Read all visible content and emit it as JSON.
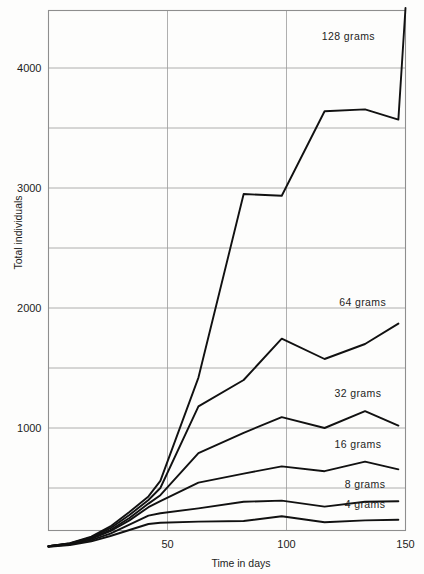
{
  "chart_data": {
    "type": "line",
    "title": "",
    "xlabel": "Time in days",
    "ylabel": "Total individuals",
    "xlim": [
      0,
      150
    ],
    "ylim": [
      0,
      4600
    ],
    "grid": true,
    "grid_x_values": [
      50,
      100
    ],
    "grid_y_values": [
      500,
      1000,
      1500,
      2000,
      2500,
      3000,
      3500,
      4000
    ],
    "xticks": [
      50,
      100,
      150
    ],
    "xtick_labels": [
      "50",
      "100",
      "150"
    ],
    "yticks": [
      1000,
      2000,
      3000,
      4000
    ],
    "ytick_labels": [
      "1000",
      "2000",
      "3000",
      "4000"
    ],
    "legend_position": "inline-labels",
    "series": [
      {
        "name": "128 grams",
        "label": "128 grams",
        "x": [
          0,
          9,
          18,
          26,
          34,
          42,
          47,
          63,
          82,
          98,
          116,
          133,
          147,
          150
        ],
        "values": [
          15,
          40,
          95,
          180,
          300,
          430,
          560,
          1420,
          2950,
          2935,
          3640,
          3655,
          3570,
          4500
        ]
      },
      {
        "name": "64 grams",
        "label": "64 grams",
        "x": [
          0,
          9,
          18,
          26,
          34,
          42,
          47,
          63,
          82,
          98,
          116,
          133,
          147
        ],
        "values": [
          15,
          38,
          88,
          165,
          275,
          400,
          500,
          1180,
          1400,
          1745,
          1575,
          1700,
          1870
        ]
      },
      {
        "name": "32 grams",
        "label": "32 grams",
        "x": [
          0,
          9,
          18,
          26,
          34,
          42,
          47,
          63,
          82,
          98,
          116,
          133,
          147
        ],
        "values": [
          15,
          36,
          82,
          150,
          250,
          370,
          440,
          790,
          960,
          1090,
          1000,
          1140,
          1020
        ]
      },
      {
        "name": "16 grams",
        "label": "16 grams",
        "x": [
          0,
          9,
          18,
          26,
          34,
          42,
          47,
          63,
          82,
          98,
          116,
          133,
          147
        ],
        "values": [
          15,
          34,
          76,
          140,
          230,
          340,
          390,
          545,
          620,
          680,
          640,
          720,
          655
        ]
      },
      {
        "name": "8 grams",
        "label": "8 grams",
        "x": [
          0,
          9,
          18,
          26,
          34,
          42,
          47,
          63,
          82,
          98,
          116,
          133,
          147
        ],
        "values": [
          12,
          30,
          66,
          120,
          195,
          270,
          290,
          330,
          385,
          395,
          345,
          385,
          390
        ]
      },
      {
        "name": "4 grams",
        "label": "4 grams",
        "x": [
          0,
          9,
          18,
          26,
          34,
          42,
          47,
          63,
          82,
          98,
          116,
          133,
          147
        ],
        "values": [
          10,
          25,
          55,
          100,
          150,
          200,
          210,
          220,
          225,
          265,
          215,
          230,
          235
        ]
      }
    ],
    "series_label_positions": [
      {
        "name": "128 grams",
        "x": 126,
        "y": 4230
      },
      {
        "name": "64 grams",
        "x": 132,
        "y": 2015
      },
      {
        "name": "32 grams",
        "x": 130,
        "y": 1255
      },
      {
        "name": "16 grams",
        "x": 130,
        "y": 830
      },
      {
        "name": "8 grams",
        "x": 133,
        "y": 500
      },
      {
        "name": "4 grams",
        "x": 133,
        "y": 330
      }
    ],
    "colors": {
      "line": "#111111",
      "grid": "#9a9a9a",
      "frame": "#8e8e8e",
      "text": "#1d1d1d",
      "background": "#fdfdfc"
    }
  }
}
